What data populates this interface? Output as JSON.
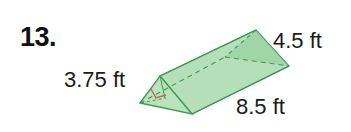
{
  "problem": {
    "number": "13.",
    "figure": "triangular-prism",
    "labels": {
      "height": "3.75 ft",
      "base": "4.5 ft",
      "length": "8.5 ft"
    },
    "colors": {
      "fill": "#9fd3a6",
      "edge": "#3f9a55",
      "right_angle_mark": "#c0664a"
    }
  }
}
